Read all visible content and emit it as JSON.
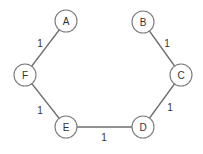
{
  "diagram": {
    "type": "undirected-weighted-graph",
    "nodes": [
      {
        "id": "A",
        "label": "A",
        "x": 66,
        "y": 21
      },
      {
        "id": "B",
        "label": "B",
        "x": 143,
        "y": 22
      },
      {
        "id": "C",
        "label": "C",
        "x": 181,
        "y": 75
      },
      {
        "id": "D",
        "label": "D",
        "x": 143,
        "y": 127
      },
      {
        "id": "E",
        "label": "E",
        "x": 66,
        "y": 127
      },
      {
        "id": "F",
        "label": "F",
        "x": 25,
        "y": 75
      }
    ],
    "edges": [
      {
        "from": "A",
        "to": "F",
        "weight": "1",
        "label_x": 40,
        "label_y": 43
      },
      {
        "from": "B",
        "to": "C",
        "weight": "1",
        "label_x": 167,
        "label_y": 43
      },
      {
        "from": "F",
        "to": "E",
        "weight": "1",
        "label_x": 40,
        "label_y": 110
      },
      {
        "from": "C",
        "to": "D",
        "weight": "1",
        "label_x": 170,
        "label_y": 107
      },
      {
        "from": "E",
        "to": "D",
        "weight": "1",
        "label_x": 104,
        "label_y": 137
      }
    ],
    "node_radius": 11,
    "colors": {
      "edge": "#6e6e6e",
      "node_stroke": "#7a7a7a",
      "text": "#333333",
      "background": "#ffffff"
    }
  }
}
